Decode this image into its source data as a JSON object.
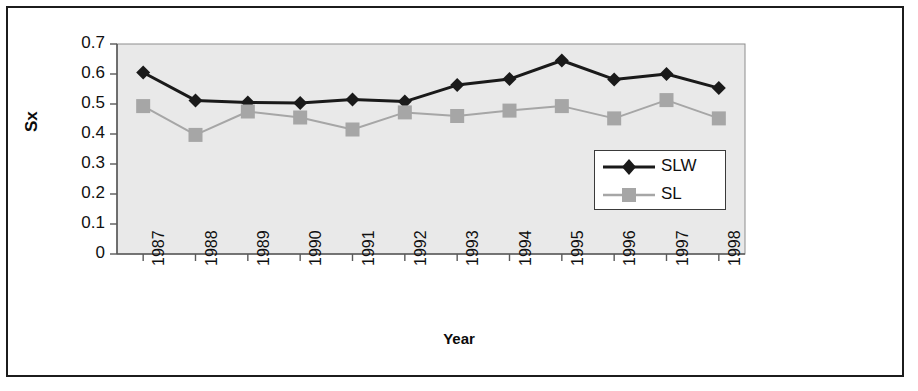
{
  "figure": {
    "background_color": "#ffffff",
    "frame_color": "#1c1c1c",
    "plot_area_fill": "#e9e9e9",
    "plot_area_border": "#8a8a8a"
  },
  "chart_data": {
    "type": "line",
    "title": "",
    "xlabel": "Year",
    "ylabel": "Sx",
    "categories": [
      "1987",
      "1988",
      "1989",
      "1990",
      "1991",
      "1992",
      "1993",
      "1994",
      "1995",
      "1996",
      "1997",
      "1998"
    ],
    "x": [
      1987,
      1988,
      1989,
      1990,
      1991,
      1992,
      1993,
      1994,
      1995,
      1996,
      1997,
      1998
    ],
    "ylim": [
      0,
      0.7
    ],
    "yticks": [
      0,
      0.1,
      0.2,
      0.3,
      0.4,
      0.5,
      0.6,
      0.7
    ],
    "ytick_labels": [
      "0",
      "0.1",
      "0.2",
      "0.3",
      "0.4",
      "0.5",
      "0.6",
      "0.7"
    ],
    "grid": false,
    "legend_position": "inside-right-middle",
    "series": [
      {
        "name": "SLW",
        "color": "#1a1a1a",
        "marker": "diamond",
        "values": [
          0.605,
          0.512,
          0.505,
          0.503,
          0.515,
          0.508,
          0.563,
          0.583,
          0.645,
          0.582,
          0.6,
          0.553
        ]
      },
      {
        "name": "SL",
        "color": "#a6a6a6",
        "marker": "square",
        "values": [
          0.493,
          0.397,
          0.475,
          0.455,
          0.415,
          0.472,
          0.46,
          0.478,
          0.493,
          0.452,
          0.513,
          0.452
        ]
      }
    ]
  },
  "legend": {
    "entries": [
      {
        "label": "SLW",
        "color": "#1a1a1a",
        "marker": "diamond"
      },
      {
        "label": "SL",
        "color": "#a6a6a6",
        "marker": "square"
      }
    ]
  }
}
